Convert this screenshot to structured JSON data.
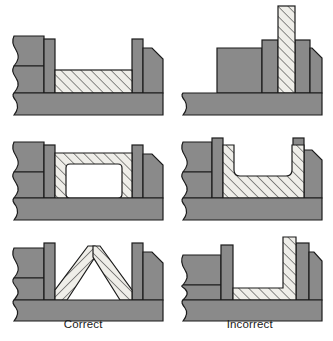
{
  "figure": {
    "columns": [
      {
        "id": "correct",
        "label": "Correct"
      },
      {
        "id": "incorrect",
        "label": "Incorrect"
      }
    ],
    "colors": {
      "mold_gray": "#8a8a8a",
      "mold_gray_dark": "#7c7c7c",
      "hatch_fill": "#efeee9",
      "hatch_line": "#2a2a2a",
      "outline": "#1b1b1b",
      "background": "#ffffff"
    },
    "hatch": {
      "angle_deg": 45,
      "spacing_px": 5,
      "line_width_px": 1
    },
    "panels": [
      {
        "id": "row1-correct",
        "row": 1,
        "column": "correct",
        "caption": "Correct",
        "description": "Flat horizontal section of uniform thickness seated between two vertical mold walls; metal thickness is constant and shallow."
      },
      {
        "id": "row1-incorrect",
        "row": 1,
        "column": "incorrect",
        "caption": "Incorrect",
        "description": "Tall slender vertical rib projecting far above the mold body; isolated thin column is difficult to fill and prone to defects."
      },
      {
        "id": "row2-correct",
        "row": 2,
        "column": "correct",
        "caption": "Correct",
        "description": "Closed hollow box section with uniform wall thickness on all four sides and generous inner fillet radii."
      },
      {
        "id": "row2-incorrect",
        "row": 2,
        "column": "incorrect",
        "caption": "Incorrect",
        "description": "Open U-shaped channel with thin unsupported side walls and a shallow floor; unequal sections and sharp junctions."
      },
      {
        "id": "row3-correct",
        "row": 3,
        "column": "correct",
        "caption": "Correct",
        "description": "A-frame triangular rib of uniform thickness bridging between the two mold walls; self-supporting peaked section."
      },
      {
        "id": "row3-incorrect",
        "row": 3,
        "column": "incorrect",
        "caption": "Incorrect",
        "description": "Thin L-shaped web with one tall vertical leg and a thin horizontal floor meeting at an abrupt corner."
      }
    ],
    "annotations": {
      "break_line": "S-shaped break line on the left edge of each section view indicating the part continues",
      "chamfer": "45-degree chamfer on the upper right corner of each mold block"
    }
  }
}
